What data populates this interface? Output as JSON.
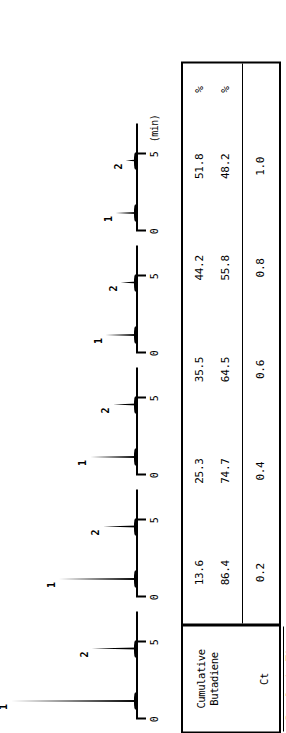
{
  "figure": {
    "orientation": "rotated-90-ccw",
    "axis_unit_label": "(min)",
    "tick_labels": [
      "0",
      "5"
    ],
    "peak_labels": [
      "1",
      "2"
    ]
  },
  "chart_data": {
    "type": "line",
    "title": "",
    "subtitle": "",
    "xlabel": "(min)",
    "ylabel": "",
    "xlim": [
      0,
      7
    ],
    "ylim": [
      0,
      100
    ],
    "grid": false,
    "legend": "none",
    "annotations": [
      "1",
      "2"
    ],
    "panel_tick_values": [
      0,
      5
    ],
    "panels": [
      {
        "name": "panel-1",
        "pyrolysis_time_s": "0.2",
        "cumulative_butadiene_pct": "13.6",
        "ct_pct": "86.4",
        "peaks": [
          {
            "label": "1",
            "retention_min": 1.2,
            "height_pct": 100
          },
          {
            "label": "2",
            "retention_min": 4.6,
            "height_pct": 36
          }
        ]
      },
      {
        "name": "panel-2",
        "pyrolysis_time_s": "0.4",
        "cumulative_butadiene_pct": "25.3",
        "ct_pct": "74.7",
        "peaks": [
          {
            "label": "1",
            "retention_min": 1.2,
            "height_pct": 62
          },
          {
            "label": "2",
            "retention_min": 4.6,
            "height_pct": 27
          }
        ]
      },
      {
        "name": "panel-3",
        "pyrolysis_time_s": "0.6",
        "cumulative_butadiene_pct": "35.5",
        "ct_pct": "64.5",
        "peaks": [
          {
            "label": "1",
            "retention_min": 1.2,
            "height_pct": 37
          },
          {
            "label": "2",
            "retention_min": 4.6,
            "height_pct": 19
          }
        ]
      },
      {
        "name": "panel-4",
        "pyrolysis_time_s": "0.8",
        "cumulative_butadiene_pct": "44.2",
        "ct_pct": "55.8",
        "peaks": [
          {
            "label": "1",
            "retention_min": 1.2,
            "height_pct": 25
          },
          {
            "label": "2",
            "retention_min": 4.6,
            "height_pct": 13
          }
        ]
      },
      {
        "name": "panel-5",
        "pyrolysis_time_s": "1.0",
        "cumulative_butadiene_pct": "51.8",
        "ct_pct": "48.2",
        "peaks": [
          {
            "label": "1",
            "retention_min": 1.2,
            "height_pct": 17
          },
          {
            "label": "2",
            "retention_min": 4.6,
            "height_pct": 9
          }
        ]
      }
    ]
  },
  "table": {
    "row_labels": {
      "top": "Cumulative\nButadiene\n\nCt",
      "bottom": "Pyrolysis\nTime (s)"
    },
    "top_row": {
      "butadiene_label": "Cumulative Butadiene",
      "ct_label": "Ct",
      "units": "%",
      "butadiene_values": [
        "13.6",
        "25.3",
        "35.5",
        "44.2",
        "51.8"
      ],
      "ct_values": [
        "86.4",
        "74.7",
        "64.5",
        "55.8",
        "48.2"
      ]
    },
    "bottom_row": {
      "label": "Pyrolysis Time (s)",
      "units": "",
      "values": [
        "0.2",
        "0.4",
        "0.6",
        "0.8",
        "1.0"
      ]
    }
  }
}
